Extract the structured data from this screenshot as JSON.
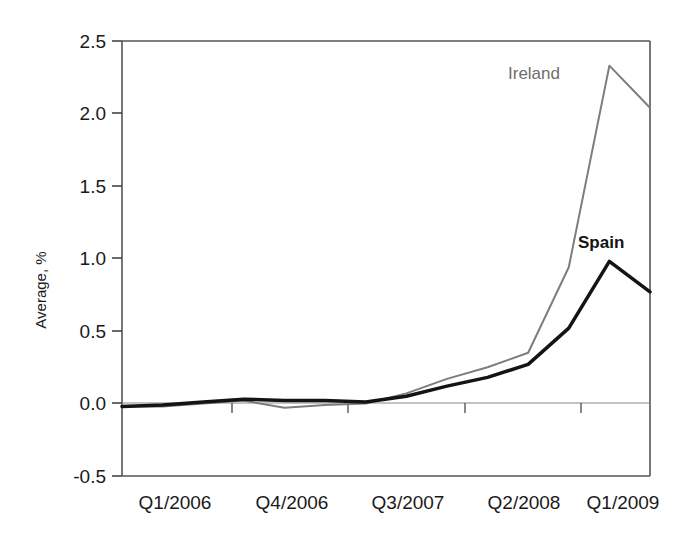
{
  "chart_data": {
    "type": "line",
    "title": "",
    "xlabel": "",
    "ylabel": "Average, %",
    "ylim": [
      -0.5,
      2.5
    ],
    "ytick_labels": [
      "2.5",
      "2.0",
      "1.5",
      "1.0",
      "0.5",
      "0.0",
      "-0.5"
    ],
    "ytick_values": [
      2.5,
      2.0,
      1.5,
      1.0,
      0.5,
      0.0,
      -0.5
    ],
    "xtick_labels": [
      "Q1/2006",
      "Q4/2006",
      "Q3/2007",
      "Q2/2008",
      "Q1/2009"
    ],
    "xtick_indices": [
      0,
      3,
      6,
      9,
      12
    ],
    "x": [
      "Q1/2006",
      "Q2/2006",
      "Q3/2006",
      "Q4/2006",
      "Q1/2007",
      "Q2/2007",
      "Q3/2007",
      "Q4/2007",
      "Q1/2008",
      "Q2/2008",
      "Q3/2008",
      "Q4/2008",
      "Q1/2009",
      "Q2/2009"
    ],
    "grid": false,
    "legend": "inline-annotations",
    "series": [
      {
        "name": "Ireland",
        "color": "#7d7d7d",
        "line_width": 2,
        "label_position": "above-peak-left",
        "values": [
          -0.02,
          -0.02,
          0.0,
          0.02,
          -0.03,
          -0.01,
          0.0,
          0.07,
          0.17,
          0.25,
          0.35,
          0.94,
          2.33,
          2.04
        ]
      },
      {
        "name": "Spain",
        "color": "#141414",
        "line_width": 3.5,
        "label_position": "above-peak-left",
        "values": [
          -0.02,
          -0.01,
          0.01,
          0.03,
          0.02,
          0.02,
          0.01,
          0.05,
          0.12,
          0.18,
          0.27,
          0.52,
          0.98,
          0.77
        ]
      }
    ],
    "axis_color": "#555555",
    "zero_line": true
  },
  "labels": {
    "ireland": "Ireland",
    "spain": "Spain"
  }
}
